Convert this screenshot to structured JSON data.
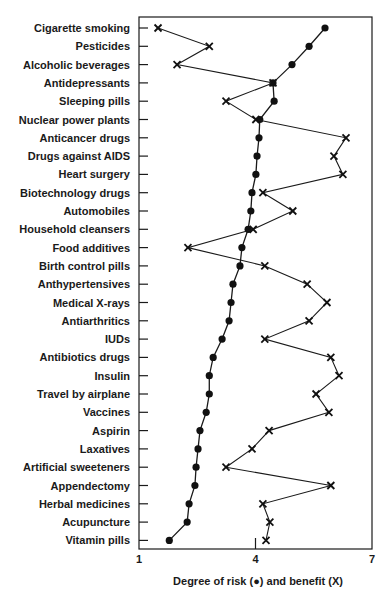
{
  "chart_data": {
    "type": "line",
    "title": "",
    "xlabel": "Degree of risk (●) and benefit (X)",
    "ylabel": "",
    "xlim": [
      1,
      7
    ],
    "xticks": [
      1,
      4,
      7
    ],
    "grid": false,
    "legend": "encoded in x-axis label",
    "categories": [
      "Cigarette smoking",
      "Pesticides",
      "Alcoholic beverages",
      "Antidepressants",
      "Sleeping pills",
      "Nuclear power plants",
      "Anticancer drugs",
      "Drugs against AIDS",
      "Heart surgery",
      "Biotechnology drugs",
      "Automobiles",
      "Household cleansers",
      "Food additives",
      "Birth control pills",
      "Anthypertensives",
      "Medical X-rays",
      "Antiarthritics",
      "IUDs",
      "Antibiotics drugs",
      "Insulin",
      "Travel by airplane",
      "Vaccines",
      "Aspirin",
      "Laxatives",
      "Artificial sweeteners",
      "Appendectomy",
      "Herbal medicines",
      "Acupuncture",
      "Vitamin pills"
    ],
    "series": [
      {
        "name": "Degree of risk",
        "marker": "dot",
        "values": [
          5.79,
          5.38,
          4.94,
          4.45,
          4.48,
          4.11,
          4.09,
          4.04,
          4.01,
          3.91,
          3.88,
          3.81,
          3.65,
          3.6,
          3.42,
          3.37,
          3.32,
          3.14,
          2.91,
          2.81,
          2.81,
          2.73,
          2.57,
          2.52,
          2.47,
          2.44,
          2.29,
          2.24,
          1.78
        ]
      },
      {
        "name": "Benefit",
        "marker": "X",
        "values": [
          1.49,
          2.81,
          1.98,
          4.45,
          3.24,
          4.01,
          6.33,
          6.02,
          6.25,
          4.19,
          4.96,
          3.94,
          2.26,
          4.24,
          5.33,
          5.84,
          5.38,
          4.24,
          5.94,
          6.15,
          5.56,
          5.89,
          4.35,
          3.91,
          3.24,
          5.94,
          4.19,
          4.37,
          4.27
        ]
      }
    ]
  }
}
